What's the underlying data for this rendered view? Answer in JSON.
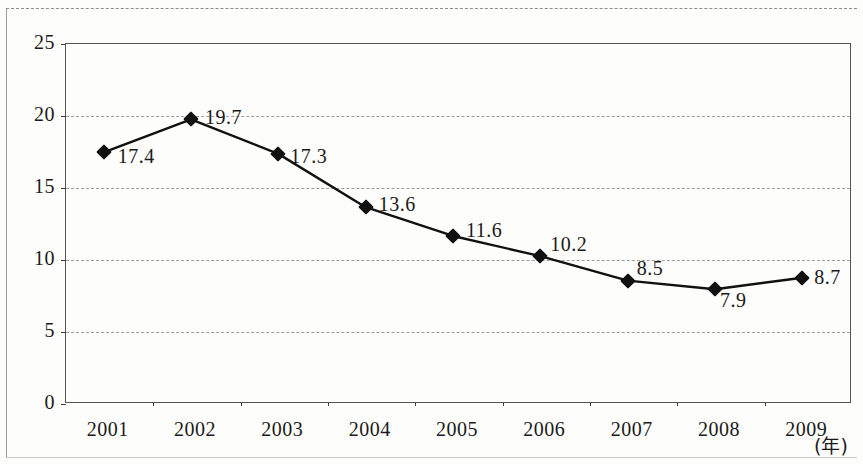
{
  "chart_data": {
    "type": "line",
    "title": "",
    "subtitle": "",
    "xlabel": "(年)",
    "ylabel": "",
    "categories": [
      "2001",
      "2002",
      "2003",
      "2004",
      "2005",
      "2006",
      "2007",
      "2008",
      "2009"
    ],
    "values": [
      17.4,
      19.7,
      17.3,
      13.6,
      11.6,
      10.2,
      8.5,
      7.9,
      8.7
    ],
    "point_labels": [
      "17.4",
      "19.7",
      "17.3",
      "13.6",
      "11.6",
      "10.2",
      "8.5",
      "7.9",
      "8.7"
    ],
    "ylim": [
      0,
      25
    ],
    "ytick_labels": [
      "25",
      "20",
      "15",
      "10",
      "5",
      "0"
    ],
    "ytick_values": [
      25,
      20,
      15,
      10,
      5,
      0
    ],
    "grid": true,
    "grid_style": "dashed-horizontal",
    "legend": "none",
    "series": [
      {
        "name": "",
        "values": [
          17.4,
          19.7,
          17.3,
          13.6,
          11.6,
          10.2,
          8.5,
          7.9,
          8.7
        ],
        "marker": "diamond",
        "color": "#111111"
      }
    ],
    "colors": {
      "line": "#111111",
      "marker": "#111111",
      "grid": "#9d9d9d",
      "axis": "#555555",
      "text": "#1a1a1a",
      "background": "#fdfdfb"
    }
  },
  "axes": {
    "y": {
      "ticks": [
        {
          "label": "25"
        },
        {
          "label": "20"
        },
        {
          "label": "15"
        },
        {
          "label": "10"
        },
        {
          "label": "5"
        },
        {
          "label": "0"
        }
      ]
    },
    "x": {
      "ticks": [
        {
          "label": "2001"
        },
        {
          "label": "2002"
        },
        {
          "label": "2003"
        },
        {
          "label": "2004"
        },
        {
          "label": "2005"
        },
        {
          "label": "2006"
        },
        {
          "label": "2007"
        },
        {
          "label": "2008"
        },
        {
          "label": "2009"
        }
      ],
      "unit": "(年)"
    }
  }
}
